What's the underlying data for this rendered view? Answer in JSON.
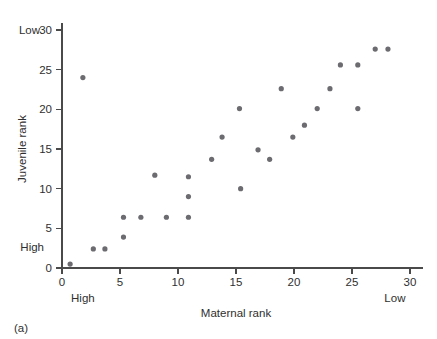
{
  "figure": {
    "panel_label": "(a)",
    "background": "#ffffff",
    "dot_color": "#6b6b70",
    "axis_color": "#4a4a4a"
  },
  "chart_data": {
    "type": "scatter",
    "title": "",
    "xlabel": "Maternal rank",
    "ylabel": "Juvenile rank",
    "xlim": [
      0,
      30
    ],
    "ylim": [
      0,
      30
    ],
    "xticks": [
      0,
      5,
      10,
      15,
      20,
      25,
      30
    ],
    "yticks": [
      0,
      5,
      10,
      15,
      20,
      25,
      30
    ],
    "xtick_labels": [
      "0",
      "5",
      "10",
      "15",
      "20",
      "25",
      "30"
    ],
    "ytick_labels": [
      "0",
      "5",
      "10",
      "15",
      "20",
      "25",
      "30"
    ],
    "grid": false,
    "legend": null,
    "axis_end_labels": {
      "x_low_end": "High",
      "x_high_end": "Low",
      "y_low_end": "High",
      "y_high_end": "Low"
    },
    "points": [
      {
        "x": 0.7,
        "y": 0.5
      },
      {
        "x": 1.8,
        "y": 24.0
      },
      {
        "x": 2.7,
        "y": 2.4
      },
      {
        "x": 3.7,
        "y": 2.4
      },
      {
        "x": 5.3,
        "y": 3.9
      },
      {
        "x": 5.3,
        "y": 6.4
      },
      {
        "x": 6.8,
        "y": 6.4
      },
      {
        "x": 8.0,
        "y": 11.7
      },
      {
        "x": 9.0,
        "y": 6.4
      },
      {
        "x": 10.9,
        "y": 6.4
      },
      {
        "x": 10.9,
        "y": 9.0
      },
      {
        "x": 10.9,
        "y": 11.5
      },
      {
        "x": 12.9,
        "y": 13.7
      },
      {
        "x": 13.8,
        "y": 16.5
      },
      {
        "x": 15.3,
        "y": 20.1
      },
      {
        "x": 15.4,
        "y": 10.0
      },
      {
        "x": 16.9,
        "y": 14.9
      },
      {
        "x": 17.9,
        "y": 13.7
      },
      {
        "x": 18.9,
        "y": 22.6
      },
      {
        "x": 19.9,
        "y": 16.5
      },
      {
        "x": 20.9,
        "y": 18.0
      },
      {
        "x": 22.0,
        "y": 20.1
      },
      {
        "x": 23.1,
        "y": 22.6
      },
      {
        "x": 24.0,
        "y": 25.6
      },
      {
        "x": 25.5,
        "y": 20.1
      },
      {
        "x": 25.5,
        "y": 25.6
      },
      {
        "x": 27.0,
        "y": 27.6
      },
      {
        "x": 28.1,
        "y": 27.6
      }
    ]
  }
}
